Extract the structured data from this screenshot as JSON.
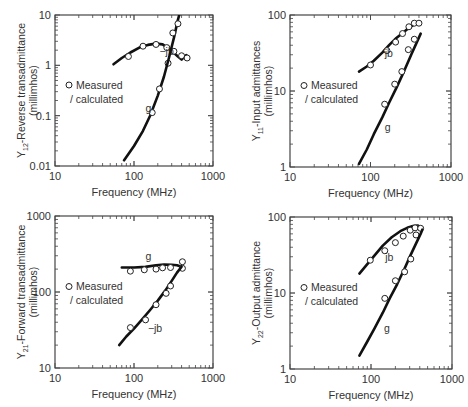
{
  "chart_data": [
    {
      "id": "y12",
      "type": "line",
      "title": "",
      "xlabel": "Frequency (MHz)",
      "ylabel_main": "Y",
      "ylabel_sub": "12",
      "ylabel_rest": "-Reverse transadmittance",
      "ylabel_units": "(millimhos)",
      "xscale": "log",
      "yscale": "log",
      "xlim": [
        10,
        1000
      ],
      "ylim": [
        0.01,
        10
      ],
      "xticks": [
        "10",
        "100",
        "1000"
      ],
      "yticks": [
        "0.01",
        "0.1",
        "1",
        "10"
      ],
      "legend": {
        "marker": "o",
        "marker_label": "Measured",
        "line_label": "/ calculated",
        "position": "left-middle"
      },
      "series": [
        {
          "name": "-jb",
          "label": "−jb",
          "label_at": [
            210,
            1.6
          ],
          "curve": [
            [
              55,
              1.05
            ],
            [
              70,
              1.4
            ],
            [
              90,
              1.8
            ],
            [
              120,
              2.3
            ],
            [
              150,
              2.55
            ],
            [
              190,
              2.7
            ],
            [
              230,
              2.6
            ],
            [
              270,
              2.2
            ],
            [
              310,
              1.85
            ],
            [
              360,
              1.5
            ],
            [
              400,
              1.3
            ],
            [
              430,
              1.45
            ],
            [
              460,
              1.6
            ]
          ],
          "measured": [
            [
              85,
              1.5
            ],
            [
              130,
              2.4
            ],
            [
              190,
              2.6
            ],
            [
              260,
              2.25
            ],
            [
              320,
              1.9
            ],
            [
              400,
              1.55
            ],
            [
              470,
              1.4
            ],
            [
              270,
              1.1
            ]
          ]
        },
        {
          "name": "g",
          "label": "g",
          "label_at": [
            140,
            0.12
          ],
          "curve": [
            [
              75,
              0.013
            ],
            [
              100,
              0.025
            ],
            [
              130,
              0.05
            ],
            [
              160,
              0.1
            ],
            [
              200,
              0.25
            ],
            [
              240,
              0.6
            ],
            [
              280,
              1.5
            ],
            [
              320,
              3.5
            ],
            [
              360,
              8
            ],
            [
              380,
              11
            ]
          ],
          "measured": [
            [
              170,
              0.115
            ],
            [
              210,
              0.34
            ],
            [
              310,
              4.4
            ],
            [
              360,
              6.7
            ]
          ]
        }
      ]
    },
    {
      "id": "y11",
      "type": "line",
      "title": "",
      "xlabel": "Frequency (MHz)",
      "ylabel_main": "Y",
      "ylabel_sub": "11",
      "ylabel_rest": "-Input admittances",
      "ylabel_units": "(millimhos)",
      "xscale": "log",
      "yscale": "log",
      "xlim": [
        10,
        1000
      ],
      "ylim": [
        1,
        100
      ],
      "xticks": [
        "10",
        "100",
        "1000"
      ],
      "yticks": [
        "1",
        "10",
        "100"
      ],
      "legend": {
        "marker": "o",
        "marker_label": "Measured",
        "line_label": "/ calculated",
        "position": "left-middle"
      },
      "series": [
        {
          "name": "jb",
          "label": "jb",
          "label_at": [
            150,
            28
          ],
          "curve": [
            [
              72,
              18
            ],
            [
              90,
              21
            ],
            [
              110,
              25
            ],
            [
              140,
              32
            ],
            [
              170,
              40
            ],
            [
              210,
              50
            ],
            [
              260,
              60
            ],
            [
              310,
              70
            ],
            [
              360,
              76
            ],
            [
              400,
              79
            ]
          ],
          "measured": [
            [
              100,
              22
            ],
            [
              160,
              34
            ],
            [
              205,
              44
            ],
            [
              250,
              57
            ],
            [
              300,
              70
            ],
            [
              350,
              78
            ],
            [
              400,
              78
            ]
          ]
        },
        {
          "name": "g",
          "label": "g",
          "label_at": [
            150,
            3
          ],
          "curve": [
            [
              72,
              1.1
            ],
            [
              90,
              1.7
            ],
            [
              110,
              2.7
            ],
            [
              140,
              4.5
            ],
            [
              170,
              7
            ],
            [
              210,
              11
            ],
            [
              260,
              18
            ],
            [
              320,
              30
            ],
            [
              380,
              45
            ],
            [
              420,
              57
            ]
          ],
          "measured": [
            [
              150,
              6.7
            ],
            [
              200,
              12.3
            ],
            [
              245,
              18
            ],
            [
              295,
              35
            ],
            [
              350,
              48
            ]
          ]
        }
      ]
    },
    {
      "id": "y21",
      "type": "line",
      "title": "",
      "xlabel": "Frequency (MHz)",
      "ylabel_main": "Y",
      "ylabel_sub": "21",
      "ylabel_rest": "-Forward transadmittance",
      "ylabel_units": "(millimhos)",
      "xscale": "log",
      "yscale": "log",
      "xlim": [
        10,
        1000
      ],
      "ylim": [
        10,
        1000
      ],
      "xticks": [
        "10",
        "100",
        "1000"
      ],
      "yticks": [
        "10",
        "100",
        "1000"
      ],
      "legend": {
        "marker": "o",
        "marker_label": "Measured",
        "line_label": "/ calculated",
        "position": "left-middle"
      },
      "series": [
        {
          "name": "g",
          "label": "g",
          "label_at": [
            140,
            260
          ],
          "curve": [
            [
              70,
              210
            ],
            [
              100,
              210
            ],
            [
              140,
              214
            ],
            [
              190,
              225
            ],
            [
              240,
              230
            ],
            [
              300,
              228
            ],
            [
              350,
              225
            ],
            [
              400,
              215
            ],
            [
              420,
              210
            ]
          ],
          "measured": [
            [
              90,
              188
            ],
            [
              135,
              196
            ],
            [
              190,
              200
            ],
            [
              230,
              208
            ],
            [
              290,
              210
            ],
            [
              410,
              250
            ],
            [
              410,
              205
            ]
          ]
        },
        {
          "name": "-jb",
          "label": "−jb",
          "label_at": [
            150,
            30
          ],
          "curve": [
            [
              65,
              20
            ],
            [
              80,
              26
            ],
            [
              100,
              33
            ],
            [
              130,
              45
            ],
            [
              160,
              58
            ],
            [
              200,
              77
            ],
            [
              250,
              105
            ],
            [
              300,
              140
            ],
            [
              350,
              180
            ],
            [
              400,
              215
            ]
          ],
          "measured": [
            [
              90,
              34
            ],
            [
              140,
              43
            ],
            [
              190,
              68
            ],
            [
              255,
              96
            ],
            [
              290,
              120
            ]
          ]
        }
      ]
    },
    {
      "id": "y22",
      "type": "line",
      "title": "",
      "xlabel": "Frequency (MHz)",
      "ylabel_main": "Y",
      "ylabel_sub": "22",
      "ylabel_rest": "-Output admittance",
      "ylabel_units": "(millimhos)",
      "xscale": "log",
      "yscale": "log",
      "xlim": [
        10,
        1000
      ],
      "ylim": [
        1,
        100
      ],
      "xticks": [
        "10",
        "100",
        "1000"
      ],
      "yticks": [
        "1",
        "10",
        "100"
      ],
      "legend": {
        "marker": "o",
        "marker_label": "Measured",
        "line_label": "/ calculated",
        "position": "left-middle"
      },
      "series": [
        {
          "name": "jb",
          "label": "jb",
          "label_at": [
            150,
            26
          ],
          "curve": [
            [
              72,
              18
            ],
            [
              90,
              24
            ],
            [
              110,
              31
            ],
            [
              140,
              42
            ],
            [
              180,
              54
            ],
            [
              230,
              65
            ],
            [
              280,
              72
            ],
            [
              330,
              76
            ],
            [
              380,
              77
            ],
            [
              420,
              72
            ]
          ],
          "measured": [
            [
              98,
              27
            ],
            [
              148,
              36
            ],
            [
              200,
              46
            ],
            [
              250,
              56
            ],
            [
              305,
              67
            ],
            [
              350,
              72
            ],
            [
              360,
              58
            ],
            [
              410,
              71
            ]
          ]
        },
        {
          "name": "g",
          "label": "g",
          "label_at": [
            145,
            3.1
          ],
          "curve": [
            [
              72,
              1.5
            ],
            [
              90,
              2.3
            ],
            [
              110,
              3.4
            ],
            [
              140,
              5.5
            ],
            [
              170,
              8.5
            ],
            [
              210,
              13
            ],
            [
              260,
              21
            ],
            [
              310,
              32
            ],
            [
              360,
              45
            ],
            [
              410,
              60
            ],
            [
              430,
              68
            ]
          ],
          "measured": [
            [
              148,
              8.5
            ],
            [
              200,
              14.5
            ],
            [
              260,
              19
            ],
            [
              310,
              28
            ]
          ]
        }
      ]
    }
  ],
  "panels_layout": [
    {
      "frame": [
        55,
        15,
        213,
        166
      ]
    },
    {
      "frame": [
        290,
        15,
        451,
        167
      ]
    },
    {
      "frame": [
        55,
        216,
        213,
        368
      ]
    },
    {
      "frame": [
        290,
        217,
        452,
        369
      ]
    }
  ]
}
